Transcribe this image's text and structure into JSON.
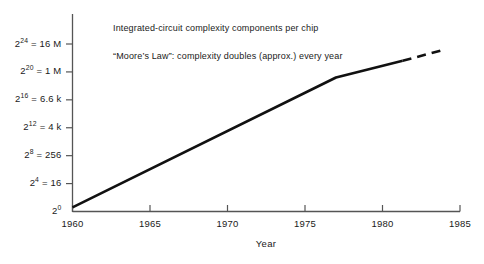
{
  "chart_data": {
    "type": "line",
    "title": "",
    "xlabel": "Year",
    "ylabel": "",
    "grid": false,
    "legend": "none",
    "xlim": [
      1960,
      1985
    ],
    "ylim_exponent": [
      0,
      26
    ],
    "y_scale": "log2",
    "x_ticks": [
      "1960",
      "1965",
      "1970",
      "1975",
      "1980",
      "1985"
    ],
    "x_tick_values": [
      1960,
      1965,
      1970,
      1975,
      1980,
      1985
    ],
    "y_ticks": [
      {
        "base": "2",
        "exponent": "24",
        "equals": "= 16 M",
        "value_exponent": 24,
        "value": 16777216
      },
      {
        "base": "2",
        "exponent": "20",
        "equals": "= 1 M",
        "value_exponent": 20,
        "value": 1048576
      },
      {
        "base": "2",
        "exponent": "16",
        "equals": "= 6.6 k",
        "value_exponent": 16,
        "value": 65536
      },
      {
        "base": "2",
        "exponent": "12",
        "equals": "= 4 k",
        "value_exponent": 12,
        "value": 4096
      },
      {
        "base": "2",
        "exponent": "8",
        "equals": "= 256",
        "value_exponent": 8,
        "value": 256
      },
      {
        "base": "2",
        "exponent": "4",
        "equals": "= 16",
        "value_exponent": 4,
        "value": 16
      },
      {
        "base": "2",
        "exponent": "0",
        "equals": "",
        "value_exponent": 0,
        "value": 1
      }
    ],
    "series": [
      {
        "name": "complexity-solid",
        "style": "solid",
        "points": [
          {
            "x": 1960.0,
            "y_exponent": 0.6
          },
          {
            "x": 1977.0,
            "y_exponent": 19.2
          },
          {
            "x": 1981.3,
            "y_exponent": 21.6
          }
        ]
      },
      {
        "name": "complexity-projected",
        "style": "dashed",
        "points": [
          {
            "x": 1981.3,
            "y_exponent": 21.6
          },
          {
            "x": 1984.0,
            "y_exponent": 23.2
          }
        ]
      }
    ],
    "annotations": [
      "Integrated-circuit complexity components per chip",
      "“Moore’s Law”:  complexity doubles (approx.) every year"
    ],
    "colors": {
      "line": "#111111",
      "axis": "#555555",
      "text": "#1a1a1a",
      "background": "#ffffff"
    }
  }
}
